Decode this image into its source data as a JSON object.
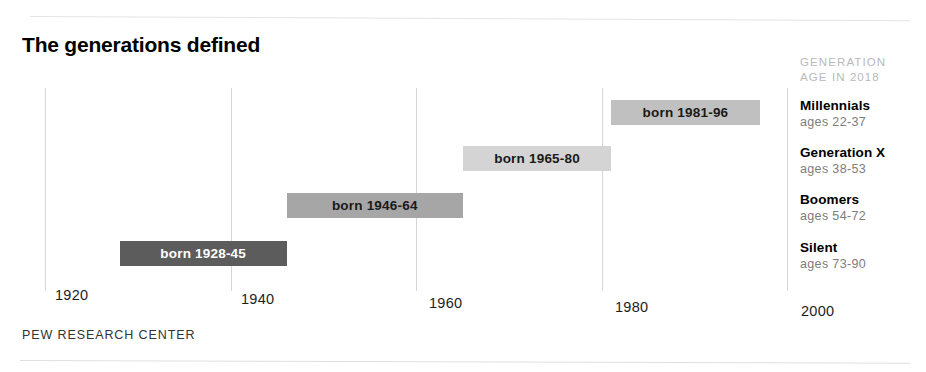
{
  "chart": {
    "title": "The generations defined",
    "source": "PEW RESEARCH CENTER"
  },
  "legend": {
    "header_line1": "GENERATION",
    "header_line2": "AGE IN 2018",
    "entries": [
      {
        "name": "Millennials",
        "ages": "ages 22-37"
      },
      {
        "name": "Generation X",
        "ages": "ages 38-53"
      },
      {
        "name": "Boomers",
        "ages": "ages 54-72"
      },
      {
        "name": "Silent",
        "ages": "ages 73-90"
      }
    ]
  },
  "chart_data": {
    "type": "bar",
    "orientation": "horizontal-range",
    "title": "The generations defined",
    "xlabel": "",
    "ylabel": "",
    "xlim": [
      1920,
      2000
    ],
    "grid": true,
    "legend_position": "right",
    "tick_labels": [
      "1920",
      "1940",
      "1960",
      "1980",
      "2000"
    ],
    "ticks": [
      1920,
      1940,
      1960,
      1980,
      2000
    ],
    "categories": [
      "Millennials",
      "Generation X",
      "Boomers",
      "Silent"
    ],
    "series": [
      {
        "name": "Millennials",
        "label": "born 1981-96",
        "start": 1981,
        "end": 1996,
        "ages": "ages 22-37",
        "color": "#c0c0c0",
        "text_color": "#1a1a1a"
      },
      {
        "name": "Generation X",
        "label": "born 1965-80",
        "start": 1965,
        "end": 1980,
        "ages": "ages 38-53",
        "color": "#d4d4d4",
        "text_color": "#1a1a1a"
      },
      {
        "name": "Boomers",
        "label": "born 1946-64",
        "start": 1946,
        "end": 1964,
        "ages": "ages 54-72",
        "color": "#a6a6a6",
        "text_color": "#1a1a1a"
      },
      {
        "name": "Silent",
        "label": "born 1928-45",
        "start": 1928,
        "end": 1945,
        "ages": "ages 73-90",
        "color": "#5c5c5c",
        "text_color": "#ffffff"
      }
    ],
    "source": "PEW RESEARCH CENTER"
  }
}
